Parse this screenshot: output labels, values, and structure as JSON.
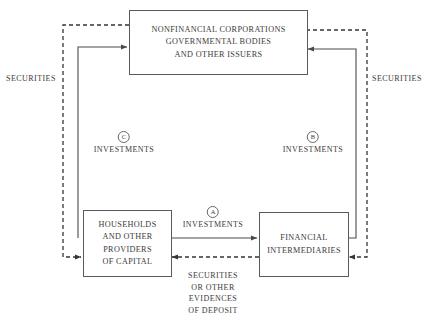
{
  "diagram": {
    "boxes": {
      "issuers": {
        "name": "nonfinancial-corporations-box",
        "lines": [
          "NONFINANCIAL CORPORATIONS",
          "GOVERNMENTAL BODIES",
          "AND OTHER ISSUERS"
        ]
      },
      "households": {
        "name": "households-box",
        "lines": [
          "HOUSEHOLDS",
          "AND OTHER",
          "PROVIDERS",
          "OF CAPITAL"
        ]
      },
      "intermediaries": {
        "name": "financial-intermediaries-box",
        "lines": [
          "FINANCIAL",
          "INTERMEDIARIES"
        ]
      }
    },
    "labels": {
      "securities_left": "SECURITIES",
      "securities_right": "SECURITIES",
      "flow_a_marker": "A",
      "flow_a_text": "INVESTMENTS",
      "flow_b_marker": "B",
      "flow_b_text": "INVESTMENTS",
      "flow_c_marker": "C",
      "flow_c_text": "INVESTMENTS",
      "deposit_line_1": "SECURITIES",
      "deposit_line_2": "OR OTHER",
      "deposit_line_3": "EVIDENCES",
      "deposit_line_4": "OF DEPOSIT"
    },
    "colors": {
      "line": "#4a4a4a",
      "dashed_line": "#353535",
      "text": "#3a3a3a",
      "background": "#ffffff"
    }
  }
}
